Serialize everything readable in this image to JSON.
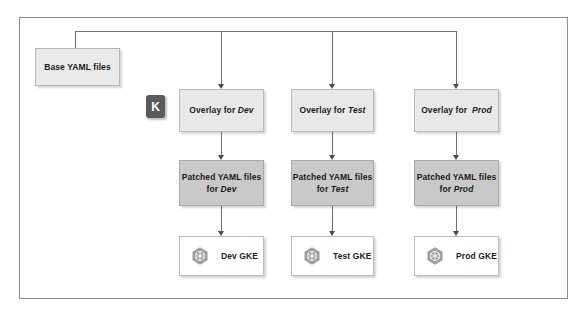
{
  "diagram": {
    "outer_frame": {
      "border_color": "#8d8d8d",
      "background": "#ffffff"
    },
    "base": {
      "label": "Base YAML files",
      "fill": "#e9e9e9"
    },
    "kustomize_badge": {
      "letter": "K",
      "icon": "kustomize-k-icon",
      "fill": "#5a5a5a",
      "text_color": "#ffffff"
    },
    "columns": [
      {
        "env": "Dev",
        "overlay_prefix": "Overlay for ",
        "overlay_env": "Dev",
        "patched_line1": "Patched YAML files",
        "patched_prefix": "for ",
        "patched_env": "Dev",
        "cluster_label": "Dev GKE",
        "cluster_icon": "kubernetes-hexagon-icon"
      },
      {
        "env": "Test",
        "overlay_prefix": "Overlay for ",
        "overlay_env": "Test",
        "patched_line1": "Patched YAML files",
        "patched_prefix": "for ",
        "patched_env": "Test",
        "cluster_label": "Test GKE",
        "cluster_icon": "kubernetes-hexagon-icon"
      },
      {
        "env": "Prod",
        "overlay_prefix": "Overlay for ",
        "overlay_env": "Prod",
        "patched_line1": "Patched YAML files",
        "patched_prefix": "for ",
        "patched_env": "Prod",
        "cluster_label": "Prod GKE",
        "cluster_icon": "kubernetes-hexagon-icon"
      }
    ],
    "colors": {
      "overlay_fill": "#e8e8e8",
      "patched_fill": "#c9c9c9",
      "cluster_fill": "#ffffff",
      "connector": "#6f6f6f",
      "arrowhead": "#4a4a4a",
      "icon_gray": "#9e9e9e"
    }
  }
}
